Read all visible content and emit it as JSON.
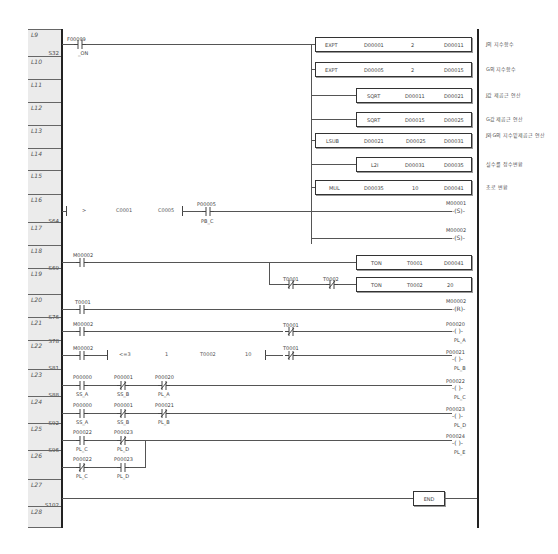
{
  "lines": [
    {
      "label": "L9",
      "top": 31,
      "step": "S32",
      "stepTop": 50
    },
    {
      "label": "L10",
      "top": 58
    },
    {
      "label": "L11",
      "top": 81
    },
    {
      "label": "L12",
      "top": 104
    },
    {
      "label": "L13",
      "top": 127
    },
    {
      "label": "L14",
      "top": 150
    },
    {
      "label": "L15",
      "top": 172
    },
    {
      "label": "L16",
      "top": 196,
      "step": "S64",
      "stepTop": 218
    },
    {
      "label": "L17",
      "top": 224
    },
    {
      "label": "L18",
      "top": 247,
      "step": "S69",
      "stepTop": 265
    },
    {
      "label": "L19",
      "top": 270
    },
    {
      "label": "L20",
      "top": 296,
      "step": "S76",
      "stepTop": 314
    },
    {
      "label": "L21",
      "top": 319,
      "step": "S78",
      "stepTop": 338
    },
    {
      "label": "L22",
      "top": 342,
      "step": "S81",
      "stepTop": 365
    },
    {
      "label": "L23",
      "top": 371,
      "step": "S88",
      "stepTop": 392
    },
    {
      "label": "L24",
      "top": 398,
      "step": "S92",
      "stepTop": 420
    },
    {
      "label": "L25",
      "top": 425,
      "step": "S96",
      "stepTop": 447
    },
    {
      "label": "L26",
      "top": 452
    },
    {
      "label": "L27",
      "top": 481,
      "step": "S102",
      "stepTop": 502
    },
    {
      "label": "L28",
      "top": 508
    }
  ],
  "rung9": {
    "contact": {
      "address": "F00099",
      "comment": "_ON"
    },
    "instructions": [
      {
        "op": "EXPT",
        "a": "D00001",
        "b": "2",
        "c": "D00011",
        "comment": "J의 지수함수"
      },
      {
        "op": "EXPT",
        "a": "D00005",
        "b": "2",
        "c": "D00015",
        "comment": "G의 지수함수"
      },
      {
        "op": "SQRT",
        "a": "D00011",
        "c": "D00021",
        "comment": "J값 제곱근 연산"
      },
      {
        "op": "SQRT",
        "a": "D00015",
        "c": "D00025",
        "comment": "G값 제곱근 연산"
      },
      {
        "op": "LSUB",
        "a": "D00021",
        "b": "D00025",
        "c": "D00031",
        "comment": "J와G의 지수밑제곱근 연산"
      },
      {
        "op": "L2I",
        "a": "D00031",
        "c": "D00035",
        "comment": "실수를 정수변환"
      },
      {
        "op": "MUL",
        "a": "D00035",
        "b": "10",
        "c": "D00041",
        "comment": "초로 변환"
      }
    ]
  },
  "rung16": {
    "compare": {
      "op": ">",
      "a": "C0001",
      "b": "C0005"
    },
    "contact": {
      "address": "P00005",
      "comment": "PB_C"
    },
    "coils": [
      {
        "address": "M00001",
        "type": "(S)"
      },
      {
        "address": "M00002",
        "type": "(S)"
      }
    ]
  },
  "rung18": {
    "contact": {
      "address": "M00002"
    },
    "timer1": {
      "op": "TON",
      "t": "T0001",
      "v": "D00041"
    },
    "nc1": {
      "address": "T0001"
    },
    "nc2": {
      "address": "T0002"
    },
    "timer2": {
      "op": "TON",
      "t": "T0002",
      "v": "20"
    }
  },
  "rung20": {
    "contact": {
      "address": "T0001"
    },
    "coil": {
      "address": "M00002",
      "type": "(R)"
    }
  },
  "rung21": {
    "contact": {
      "address": "M00002"
    },
    "nc": {
      "address": "T0001"
    },
    "coil": {
      "address": "P00020",
      "type": "( )",
      "comment": "PL_A"
    }
  },
  "rung22": {
    "contact": {
      "address": "M00002"
    },
    "compare": {
      "op": "<=3",
      "a": "1",
      "b": "T0002",
      "c": "10"
    },
    "nc": {
      "address": "T0001"
    },
    "coil": {
      "address": "P00021",
      "type": "( )",
      "comment": "PL_B"
    }
  },
  "rung23": {
    "contacts": [
      {
        "address": "P00000",
        "comment": "SS_A",
        "nc": false
      },
      {
        "address": "P00001",
        "comment": "SS_B",
        "nc": true
      },
      {
        "address": "P00020",
        "comment": "PL_A",
        "nc": true
      }
    ],
    "coil": {
      "address": "P00022",
      "type": "( )",
      "comment": "PL_C"
    }
  },
  "rung24": {
    "contacts": [
      {
        "address": "P00000",
        "comment": "SS_A",
        "nc": false
      },
      {
        "address": "P00001",
        "comment": "SS_B",
        "nc": true
      },
      {
        "address": "P00021",
        "comment": "PL_B",
        "nc": true
      }
    ],
    "coil": {
      "address": "P00023",
      "type": "( )",
      "comment": "PL_D"
    }
  },
  "rung25": {
    "row1": [
      {
        "address": "P00022",
        "comment": "PL_C",
        "nc": false
      },
      {
        "address": "P00023",
        "comment": "PL_D",
        "nc": true
      }
    ],
    "row2": [
      {
        "address": "P00022",
        "comment": "PL_C",
        "nc": true
      },
      {
        "address": "P00023",
        "comment": "PL_D",
        "nc": false
      }
    ],
    "coil": {
      "address": "P00024",
      "type": "( )",
      "comment": "PL_E"
    }
  },
  "rung27": {
    "op": "END"
  }
}
